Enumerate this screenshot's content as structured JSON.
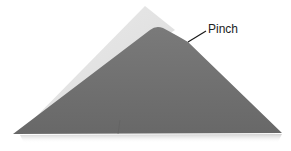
{
  "illustration": {
    "subject": "origami-triangle-fold",
    "annotation": {
      "label": "Pinch"
    },
    "colors": {
      "back_layer": "#e2e2e2",
      "front_layer": "#6f6f6f",
      "shadow": "#d6d6d6",
      "leader_line": "#1a1a1a",
      "background": "#ffffff"
    }
  }
}
